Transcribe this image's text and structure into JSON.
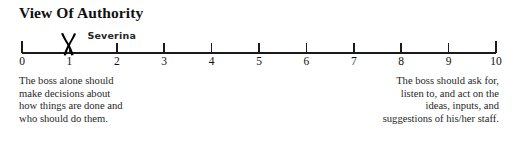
{
  "item": {
    "title": "View Of Authority",
    "respondent_mark": {
      "label": "Severina",
      "value": 1,
      "glyph": "x-mark"
    }
  },
  "scale": {
    "min": 0,
    "max": 10,
    "ticks": [
      "0",
      "1",
      "2",
      "3",
      "4",
      "5",
      "6",
      "7",
      "8",
      "9",
      "10"
    ]
  },
  "anchors": {
    "left": {
      "lines": [
        "The boss alone should",
        "make decisions about",
        "how things are done and",
        "who should do them."
      ]
    },
    "right": {
      "lines": [
        "The boss should ask for,",
        "listen to, and act on the",
        "ideas, inputs, and",
        "suggestions of his/her staff."
      ]
    }
  },
  "colors": {
    "ink": "#1a1a1a",
    "mark": "#000000",
    "background": "#ffffff"
  },
  "chart_data": {
    "type": "scatter",
    "title": "View Of Authority",
    "xlabel": "",
    "ylabel": "",
    "xlim": [
      0,
      10
    ],
    "grid": false,
    "legend": "none",
    "categories": [
      "0",
      "1",
      "2",
      "3",
      "4",
      "5",
      "6",
      "7",
      "8",
      "9",
      "10"
    ],
    "series": [
      {
        "name": "Severina",
        "x": [
          1
        ],
        "values": [
          1
        ],
        "marker": "x"
      }
    ],
    "annotations": [
      {
        "text": "Severina",
        "x": 1.45,
        "note": "handwritten rater name above the X mark"
      },
      {
        "text": "The boss alone should make decisions about how things are done and who should do them.",
        "x": 0,
        "note": "low-end anchor description"
      },
      {
        "text": "The boss should ask for, listen to, and act on the ideas, inputs, and suggestions of his/her staff.",
        "x": 10,
        "note": "high-end anchor description"
      }
    ]
  }
}
